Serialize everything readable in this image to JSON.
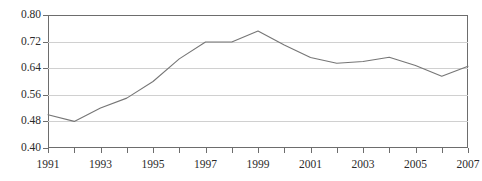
{
  "chart_data": {
    "type": "line",
    "title": "",
    "subtitle": "",
    "xlabel": "",
    "ylabel": "",
    "x": [
      1991,
      1992,
      1993,
      1994,
      1995,
      1996,
      1997,
      1998,
      1999,
      2000,
      2001,
      2002,
      2003,
      2004,
      2005,
      2006,
      2007
    ],
    "series": [
      {
        "name": "series-1",
        "values": [
          0.5,
          0.48,
          0.52,
          0.55,
          0.6,
          0.668,
          0.719,
          0.719,
          0.752,
          0.71,
          0.672,
          0.655,
          0.66,
          0.673,
          0.648,
          0.616,
          0.646
        ]
      }
    ],
    "xlim": [
      1991,
      2007
    ],
    "ylim": [
      0.4,
      0.8
    ],
    "y_ticks": [
      0.4,
      0.48,
      0.56,
      0.64,
      0.72,
      0.8
    ],
    "y_tick_labels": [
      "0.40",
      "0.48",
      "0.56",
      "0.64",
      "0.72",
      "0.80"
    ],
    "x_ticks": [
      1991,
      1992,
      1993,
      1994,
      1995,
      1996,
      1997,
      1998,
      1999,
      2000,
      2001,
      2002,
      2003,
      2004,
      2005,
      2006,
      2007
    ],
    "x_tick_labels": [
      "1991",
      "",
      "1993",
      "",
      "1995",
      "",
      "1997",
      "",
      "1999",
      "",
      "2001",
      "",
      "2003",
      "",
      "2005",
      "",
      "2007"
    ],
    "x_labeled_ticks": [
      "1991",
      "1993",
      "1995",
      "1997",
      "1999",
      "2001",
      "2003",
      "2005",
      "2007"
    ],
    "grid": "horizontal",
    "legend": "none",
    "line_color": "#767676",
    "grid_color": "#d0d0d0",
    "axis_color": "#6d6d6d",
    "text_color": "#2b2b2b",
    "background_color": "#ffffff",
    "markers": false,
    "annotations": []
  }
}
